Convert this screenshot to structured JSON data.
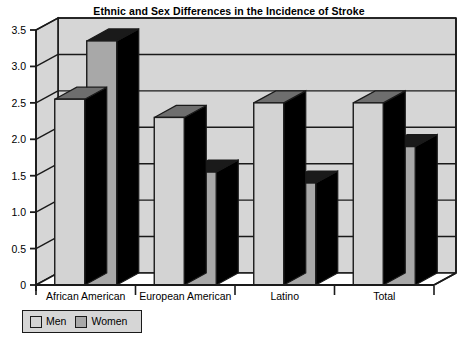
{
  "chart_data": {
    "type": "bar",
    "title": "Ethnic and Sex Differences in the Incidence of Stroke",
    "xlabel": "",
    "ylabel": "",
    "categories": [
      "African American",
      "European American",
      "Latino",
      "Total"
    ],
    "series": [
      {
        "name": "Men",
        "values": [
          2.55,
          2.3,
          2.5,
          2.5
        ],
        "color": "#d3d3d3"
      },
      {
        "name": "Women",
        "values": [
          3.35,
          1.55,
          1.4,
          1.9
        ],
        "color": "#a8a8a8"
      }
    ],
    "ylim": [
      0,
      3.5
    ],
    "yticks": [
      "0",
      "0.5",
      "1.0",
      "1.5",
      "2.0",
      "2.5",
      "3.0",
      "3.5"
    ],
    "ytick_values": [
      0,
      0.5,
      1.0,
      1.5,
      2.0,
      2.5,
      3.0,
      3.5
    ],
    "grid": true,
    "grid_axis": "y",
    "legend_position": "below-left",
    "style": "3d-column",
    "plot_background": "#d6d6d6",
    "axis_color": "#1a1a1a",
    "bar_side_color": "#000000",
    "bar_top_color_men": "#6e6e6e",
    "bar_top_color_women": "#1a1a1a"
  },
  "legend": {
    "entries": [
      {
        "label": "Men"
      },
      {
        "label": "Women"
      }
    ]
  }
}
